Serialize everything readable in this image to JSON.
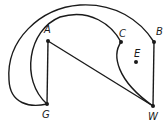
{
  "diagram": {
    "type": "graph",
    "vertices": [
      {
        "id": "A",
        "label": "A",
        "x": 48,
        "y": 41,
        "lx": 44,
        "ly": 33
      },
      {
        "id": "B",
        "label": "B",
        "x": 154,
        "y": 42,
        "lx": 156,
        "ly": 35
      },
      {
        "id": "C",
        "label": "C",
        "x": 121,
        "y": 42,
        "lx": 119,
        "ly": 36
      },
      {
        "id": "E",
        "label": "E",
        "x": 136,
        "y": 62,
        "lx": 134,
        "ly": 57
      },
      {
        "id": "G",
        "label": "G",
        "x": 47,
        "y": 104,
        "lx": 42,
        "ly": 118
      },
      {
        "id": "W",
        "label": "W",
        "x": 153,
        "y": 106,
        "lx": 149,
        "ly": 121
      }
    ],
    "edges": [
      {
        "from": "A",
        "to": "G",
        "shape": "straight"
      },
      {
        "from": "A",
        "to": "W",
        "shape": "straight"
      },
      {
        "from": "B",
        "to": "W",
        "shape": "straight"
      },
      {
        "from": "C",
        "to": "W",
        "shape": "curved"
      },
      {
        "from": "G",
        "to": "C",
        "shape": "curved"
      },
      {
        "from": "G",
        "to": "B",
        "shape": "curved"
      }
    ]
  }
}
